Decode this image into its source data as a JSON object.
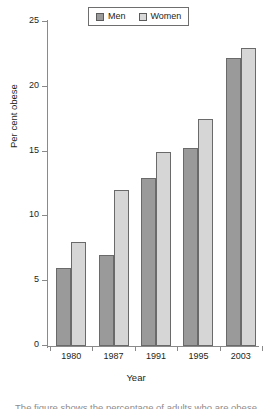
{
  "chart_data": {
    "type": "bar",
    "title": "",
    "subtitle": "",
    "xlabel": "Year",
    "ylabel": "Per cent obese",
    "categories": [
      "1980",
      "1987",
      "1991",
      "1995",
      "2003"
    ],
    "series": [
      {
        "name": "Men",
        "color": "#9a9a9a",
        "values": [
          6,
          7,
          13,
          15.3,
          22.2
        ]
      },
      {
        "name": "Women",
        "color": "#d6d6d6",
        "values": [
          8,
          12,
          15,
          17.5,
          23
        ]
      }
    ],
    "ylim": [
      0,
      25
    ],
    "yticks": [
      0,
      5,
      10,
      15,
      20,
      25
    ],
    "ytick_labels": [
      "0",
      "5",
      "10",
      "15",
      "20",
      "25"
    ],
    "grid": false,
    "legend_position": "top-center",
    "legend_entries": [
      "Men",
      "Women"
    ]
  },
  "legend": {
    "men_label": "Men",
    "women_label": "Women"
  },
  "axes": {
    "y_title": "Per cent obese",
    "x_title": "Year"
  },
  "caption_cut": "The figure shows the percentage of adults who are obese"
}
